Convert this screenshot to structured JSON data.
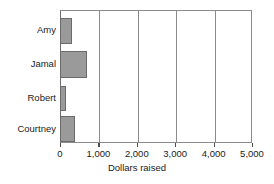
{
  "chart_data": {
    "type": "bar",
    "orientation": "horizontal",
    "title": "",
    "xlabel": "Dollars raised",
    "ylabel": "",
    "categories": [
      "Amy",
      "Jamal",
      "Robert",
      "Courtney"
    ],
    "values": [
      300,
      700,
      150,
      400
    ],
    "xlim": [
      0,
      5000
    ],
    "xticks": [
      0,
      1000,
      2000,
      3000,
      4000,
      5000
    ],
    "xtick_labels": [
      "0",
      "1,000",
      "2,000",
      "3,000",
      "4,000",
      "5,000"
    ],
    "grid": true,
    "grid_axis": "x",
    "legend": null,
    "bar_fill_color": "#9a9a9a",
    "bar_edge_color": "#6b6b6b",
    "axis_color": "#8b8b8b",
    "background_color": "#ffffff"
  }
}
